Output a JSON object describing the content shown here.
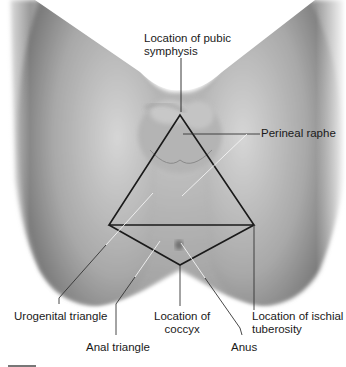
{
  "figure": {
    "labels": {
      "pubic_symphysis": {
        "line1": "Location of pubic",
        "line2": "symphysis"
      },
      "perineal_raphe": {
        "line1": "Perineal raphe"
      },
      "urogenital_triangle": {
        "line1": "Urogenital triangle"
      },
      "anal_triangle": {
        "line1": "Anal triangle"
      },
      "coccyx": {
        "line1": "Location of",
        "line2": "coccyx"
      },
      "anus": {
        "line1": "Anus"
      },
      "ischial_tuberosity": {
        "line1": "Location of ischial",
        "line2": "tuberosity"
      }
    },
    "colors": {
      "outline": "#1a1a1a",
      "leader_light": "#f2f2f2",
      "skin_dark": "#8a8a8a",
      "skin_light": "#cfcfcf",
      "background": "#ffffff"
    }
  }
}
